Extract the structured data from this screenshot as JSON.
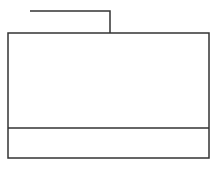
{
  "diagram": {
    "stroke_color": "#333333",
    "background": "#ffffff",
    "connector": {
      "points": [
        [
          30,
          11
        ],
        [
          110,
          11
        ],
        [
          110,
          33
        ]
      ]
    },
    "box": {
      "x": 8,
      "y": 33,
      "width": 201,
      "height": 125
    },
    "divider": {
      "y": 128
    },
    "labels": []
  }
}
